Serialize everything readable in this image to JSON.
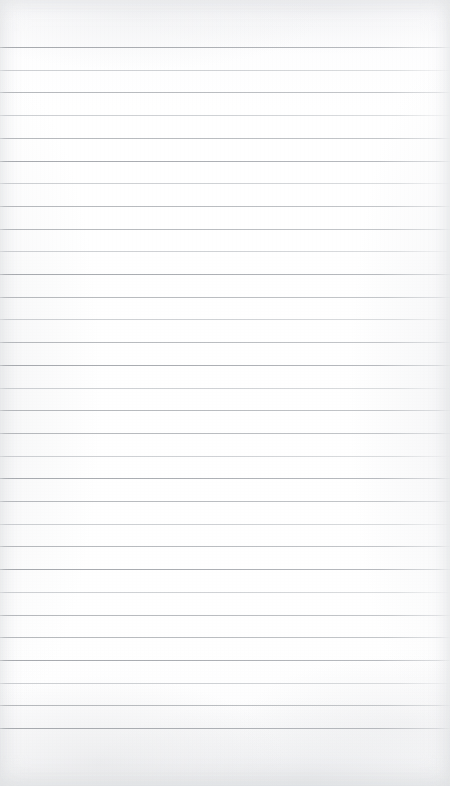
{
  "document": {
    "kind": "scanned-ruled-paper",
    "title": "Blank Ruled Notebook Paper",
    "page_width": 450,
    "page_height": 786,
    "paper_color": "#fdfdfd",
    "text_content": "",
    "handwriting_present": false,
    "printed_text_present": false
  },
  "ruling": {
    "label": "horizontal ruled lines",
    "line_color": "#b6b9bd",
    "line_color_dark": "#aaadb2",
    "line_color_light": "#c5c8cc",
    "line_thickness_px": 1,
    "line_spacing_px": 22.7,
    "first_line_y": 47,
    "last_line_y": 728,
    "line_count": 31,
    "line_left_x": 0,
    "line_right_x": 450,
    "margin_rule_present": false,
    "top_margin_px": 47,
    "bottom_margin_px": 58,
    "lines_y": [
      47.0,
      69.7,
      92.4,
      115.1,
      137.8,
      160.5,
      183.2,
      205.9,
      228.6,
      251.3,
      274.0,
      296.7,
      319.4,
      342.1,
      364.8,
      387.5,
      410.2,
      432.9,
      455.6,
      478.3,
      501.0,
      523.7,
      546.4,
      569.1,
      591.8,
      614.5,
      637.2,
      659.9,
      682.6,
      705.3,
      728.0
    ],
    "line_weights": [
      "dark",
      "light",
      "normal",
      "light",
      "normal",
      "dark",
      "light",
      "normal",
      "normal",
      "light",
      "dark",
      "normal",
      "light",
      "normal",
      "dark",
      "light",
      "normal",
      "normal",
      "light",
      "dark",
      "normal",
      "light",
      "normal",
      "dark",
      "light",
      "normal",
      "normal",
      "dark",
      "light",
      "normal",
      "dark"
    ]
  }
}
